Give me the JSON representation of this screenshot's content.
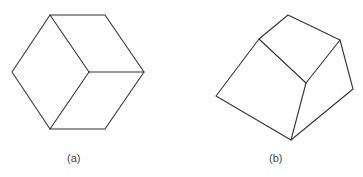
{
  "figures": [
    {
      "id": "a",
      "label": "(a)",
      "description": "Hexagon outline divided into three rhombi meeting at an interior point (cube-like line drawing)",
      "vertices": {
        "top_left": [
          50,
          15
        ],
        "top_right": [
          105,
          15
        ],
        "right": [
          144,
          72
        ],
        "bottom_right": [
          105,
          129
        ],
        "bottom_left": [
          50,
          129
        ],
        "left": [
          12,
          72
        ],
        "center": [
          89,
          72
        ]
      },
      "label_pos": [
        73,
        152
      ]
    },
    {
      "id": "b",
      "label": "(b)",
      "description": "Polyhedral solid line drawing with three visible faces meeting at an interior point",
      "vertices": {
        "top": [
          288,
          15
        ],
        "top_left": [
          259,
          39
        ],
        "top_right": [
          340,
          40
        ],
        "mid": [
          306,
          83
        ],
        "left": [
          216,
          96
        ],
        "right": [
          353,
          89
        ],
        "bottom": [
          291,
          140
        ]
      },
      "label_pos": [
        275,
        152
      ]
    }
  ],
  "colors": {
    "line": "#333333",
    "label": "#444444",
    "background": "#ffffff"
  }
}
